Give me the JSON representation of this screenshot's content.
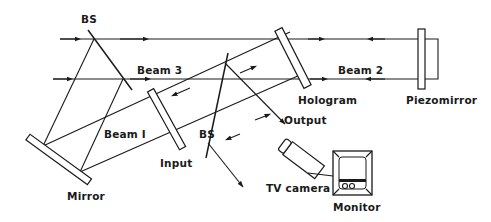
{
  "diagram": {
    "type": "optical-setup",
    "labels": {
      "bs_top": "BS",
      "bs_center": "BS",
      "beam1": "Beam I",
      "beam2": "Beam 2",
      "beam3": "Beam 3",
      "hologram": "Hologram",
      "piezomirror": "Piezomirror",
      "input": "Input",
      "output": "Output",
      "mirror": "Mirror",
      "tv_camera": "TV camera",
      "monitor": "Monitor"
    },
    "components": [
      {
        "name": "BS",
        "kind": "beam-splitter",
        "position": "top-left"
      },
      {
        "name": "Mirror",
        "kind": "mirror",
        "position": "bottom-left"
      },
      {
        "name": "Input",
        "kind": "transparency-plate",
        "position": "center-left"
      },
      {
        "name": "BS",
        "kind": "beam-splitter",
        "position": "center"
      },
      {
        "name": "Hologram",
        "kind": "hologram-plate",
        "position": "center-right"
      },
      {
        "name": "Piezomirror",
        "kind": "piezo-mirror",
        "position": "right"
      },
      {
        "name": "TV camera",
        "kind": "camera",
        "position": "bottom-center"
      },
      {
        "name": "Monitor",
        "kind": "display",
        "position": "bottom-right"
      }
    ],
    "colors": {
      "ink": "#1a1a1a",
      "background": "#ffffff"
    }
  }
}
